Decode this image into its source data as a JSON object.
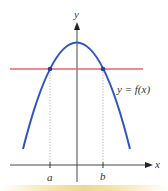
{
  "diagram": {
    "labels": {
      "y_axis": "y",
      "x_axis": "x",
      "curve": "y = f(x)",
      "point_a": "a",
      "point_b": "b"
    },
    "colors": {
      "curve": "#2e55c0",
      "horizontal_line": "#e8646e",
      "axes": "#333333",
      "guides": "#999999",
      "bottom_band": "#e9c96a"
    }
  }
}
